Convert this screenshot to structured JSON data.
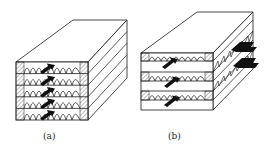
{
  "figure": {
    "type": "stacked plate-fin heat exchanger core schematic",
    "panels": [
      {
        "id": "a",
        "caption": "(a)",
        "description": "Five stacked fin layers with flow arrows all in the same direction (co-current / parallel flow)",
        "layers": 5,
        "arrangement": "contiguous",
        "flow_arrows": 5
      },
      {
        "id": "b",
        "caption": "(b)",
        "description": "Alternating layers with perpendicular fin orientation showing cross-flow arrangement",
        "layers": 3,
        "arrangement": "alternating cross-flow",
        "flow_arrows_front": 3,
        "flow_arrows_side": 2
      }
    ]
  },
  "colors": {
    "line": "#1a1a1a",
    "hatch": "#555555",
    "arrow": "#111111",
    "background": "#ffffff"
  }
}
